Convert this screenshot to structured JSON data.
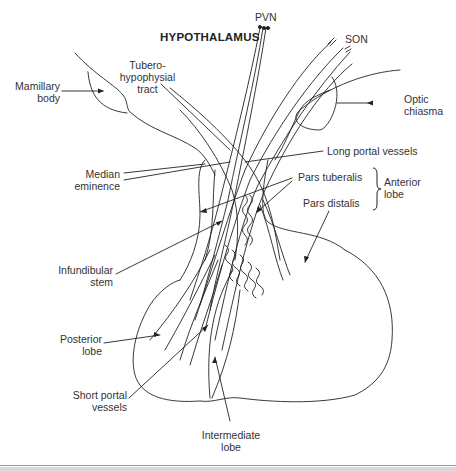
{
  "figure": {
    "title": "HYPOTHALAMUS",
    "labels": {
      "pvn": "PVN",
      "son": "SON",
      "mamillary_body": [
        "Mamillary",
        "body"
      ],
      "tuberohypophysial_tract": [
        "Tubero-",
        "hypophysial",
        "tract"
      ],
      "optic_chiasma": [
        "Optic",
        "chiasma"
      ],
      "long_portal_vessels": "Long portal vessels",
      "median_eminence": [
        "Median",
        "eminence"
      ],
      "pars_tuberalis": "Pars tuberalis",
      "pars_distalis": "Pars distalis",
      "anterior_lobe": [
        "Anterior",
        "lobe"
      ],
      "infundibular_stem": [
        "Infundibular",
        "stem"
      ],
      "posterior_lobe": [
        "Posterior",
        "lobe"
      ],
      "short_portal_vessels": [
        "Short portal",
        "vessels"
      ],
      "intermediate_lobe": [
        "Intermediate",
        "lobe"
      ]
    },
    "colors": {
      "line": "#222222",
      "text": "#333333",
      "background": "#ffffff"
    }
  }
}
